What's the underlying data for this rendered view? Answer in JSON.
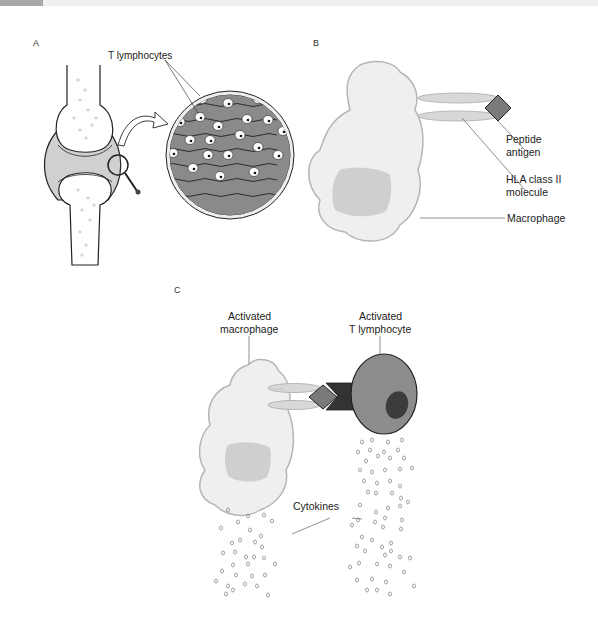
{
  "figure": {
    "panels": [
      {
        "id": "A",
        "letter": "A",
        "labels": {
          "t_lymphocytes": "T lymphocytes"
        },
        "elements": [
          "knee-joint",
          "magnifier",
          "zoomed-synovium-circle"
        ]
      },
      {
        "id": "B",
        "letter": "B",
        "labels": {
          "peptide_antigen_l1": "Peptide",
          "peptide_antigen_l2": "antigen",
          "hla_l1": "HLA class II",
          "hla_l2": "molecule",
          "macrophage": "Macrophage"
        }
      },
      {
        "id": "C",
        "letter": "C",
        "labels": {
          "activated_macrophage_l1": "Activated",
          "activated_macrophage_l2": "macrophage",
          "activated_t_l1": "Activated",
          "activated_t_l2": "T lymphocyte",
          "cytokines": "Cytokines"
        }
      }
    ],
    "colors": {
      "macrophage_fill": "#efefef",
      "macrophage_stroke": "#b5b5b5",
      "nucleus_fill": "#cfcfcf",
      "antigen_fill": "#7a7a7a",
      "t_cell_fill": "#8c8c8c",
      "t_nucleus": "#3c3c3c",
      "receptor": "#3a3a3a",
      "synovium_fill": "#8a8a8a"
    }
  }
}
